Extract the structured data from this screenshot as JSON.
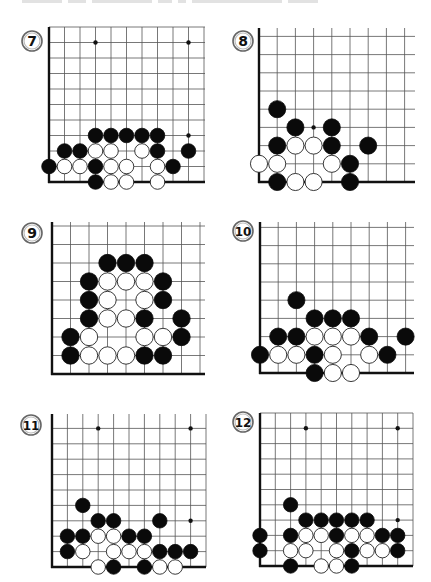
{
  "page": {
    "header_text_clipped": true
  },
  "diagrams": [
    {
      "number": "7",
      "badge": {
        "cx": 32,
        "cy": 41,
        "r": 10
      },
      "grid": {
        "origin_x": 49,
        "origin_y": 182,
        "spacing": 15.5,
        "cols": 11,
        "rows": 10,
        "right_x": 205,
        "top_y": 27
      },
      "hoshi": [
        [
          3,
          9
        ],
        [
          9,
          9
        ],
        [
          9,
          3
        ]
      ],
      "black": [
        [
          3,
          3
        ],
        [
          4,
          3
        ],
        [
          5,
          3
        ],
        [
          6,
          3
        ],
        [
          7,
          3
        ],
        [
          1,
          2
        ],
        [
          2,
          2
        ],
        [
          7,
          2
        ],
        [
          9,
          2
        ],
        [
          0,
          1
        ],
        [
          3,
          1
        ],
        [
          8,
          1
        ],
        [
          3,
          0
        ]
      ],
      "white": [
        [
          3,
          2
        ],
        [
          4,
          2
        ],
        [
          6,
          2
        ],
        [
          1,
          1
        ],
        [
          2,
          1
        ],
        [
          4,
          1
        ],
        [
          5,
          1
        ],
        [
          7,
          1
        ],
        [
          4,
          0
        ],
        [
          5,
          0
        ],
        [
          7,
          0
        ]
      ]
    },
    {
      "number": "8",
      "badge": {
        "cx": 243,
        "cy": 41,
        "r": 10
      },
      "grid": {
        "origin_x": 259,
        "origin_y": 182,
        "spacing": 18.2,
        "cols": 9,
        "rows": 9,
        "right_x": 415,
        "top_y": 28
      },
      "hoshi": [
        [
          3,
          3
        ]
      ],
      "black": [
        [
          1,
          4
        ],
        [
          2,
          3
        ],
        [
          4,
          3
        ],
        [
          1,
          2
        ],
        [
          4,
          2
        ],
        [
          6,
          2
        ],
        [
          5,
          1
        ],
        [
          1,
          0
        ],
        [
          5,
          0
        ]
      ],
      "white": [
        [
          2,
          2
        ],
        [
          3,
          2
        ],
        [
          0,
          1
        ],
        [
          1,
          1
        ],
        [
          4,
          1
        ],
        [
          2,
          0
        ],
        [
          3,
          0
        ]
      ]
    },
    {
      "number": "9",
      "badge": {
        "cx": 32,
        "cy": 233,
        "r": 10
      },
      "grid": {
        "origin_x": 52,
        "origin_y": 374,
        "spacing": 18.5,
        "cols": 9,
        "rows": 9,
        "right_x": 205,
        "top_y": 222
      },
      "hoshi": [],
      "black": [
        [
          3,
          6
        ],
        [
          4,
          6
        ],
        [
          5,
          6
        ],
        [
          2,
          5
        ],
        [
          6,
          5
        ],
        [
          2,
          4
        ],
        [
          6,
          4
        ],
        [
          2,
          3
        ],
        [
          5,
          3
        ],
        [
          7,
          3
        ],
        [
          1,
          2
        ],
        [
          7,
          2
        ],
        [
          1,
          1
        ],
        [
          5,
          1
        ],
        [
          6,
          1
        ]
      ],
      "white": [
        [
          3,
          5
        ],
        [
          4,
          5
        ],
        [
          5,
          5
        ],
        [
          3,
          4
        ],
        [
          5,
          4
        ],
        [
          3,
          3
        ],
        [
          4,
          3
        ],
        [
          2,
          2
        ],
        [
          5,
          2
        ],
        [
          6,
          2
        ],
        [
          2,
          1
        ],
        [
          3,
          1
        ],
        [
          4,
          1
        ]
      ]
    },
    {
      "number": "10",
      "badge": {
        "cx": 243,
        "cy": 231,
        "r": 10
      },
      "grid": {
        "origin_x": 260,
        "origin_y": 373,
        "spacing": 18.2,
        "cols": 9,
        "rows": 9,
        "right_x": 414,
        "top_y": 222
      },
      "hoshi": [],
      "black": [
        [
          2,
          4
        ],
        [
          3,
          3
        ],
        [
          4,
          3
        ],
        [
          5,
          3
        ],
        [
          1,
          2
        ],
        [
          2,
          2
        ],
        [
          6,
          2
        ],
        [
          8,
          2
        ],
        [
          0,
          1
        ],
        [
          3,
          1
        ],
        [
          7,
          1
        ],
        [
          3,
          0
        ]
      ],
      "white": [
        [
          3,
          2
        ],
        [
          4,
          2
        ],
        [
          5,
          2
        ],
        [
          1,
          1
        ],
        [
          2,
          1
        ],
        [
          4,
          1
        ],
        [
          6,
          1
        ],
        [
          4,
          0
        ],
        [
          5,
          0
        ]
      ]
    },
    {
      "number": "11",
      "badge": {
        "cx": 31,
        "cy": 425,
        "r": 10
      },
      "grid": {
        "origin_x": 52,
        "origin_y": 567,
        "spacing": 15.4,
        "cols": 11,
        "rows": 10,
        "right_x": 206,
        "top_y": 414
      },
      "hoshi": [
        [
          3,
          9
        ],
        [
          9,
          9
        ],
        [
          9,
          3
        ]
      ],
      "black": [
        [
          2,
          4
        ],
        [
          3,
          3
        ],
        [
          4,
          3
        ],
        [
          7,
          3
        ],
        [
          1,
          2
        ],
        [
          2,
          2
        ],
        [
          5,
          2
        ],
        [
          6,
          2
        ],
        [
          1,
          1
        ],
        [
          7,
          1
        ],
        [
          8,
          1
        ],
        [
          9,
          1
        ],
        [
          4,
          0
        ],
        [
          6,
          0
        ]
      ],
      "white": [
        [
          3,
          2
        ],
        [
          4,
          2
        ],
        [
          2,
          1
        ],
        [
          4,
          1
        ],
        [
          5,
          1
        ],
        [
          6,
          1
        ],
        [
          3,
          0
        ],
        [
          7,
          0
        ],
        [
          8,
          0
        ]
      ]
    },
    {
      "number": "12",
      "badge": {
        "cx": 243,
        "cy": 422,
        "r": 10
      },
      "grid": {
        "origin_x": 260,
        "origin_y": 566,
        "spacing": 15.3,
        "cols": 11,
        "rows": 10,
        "right_x": 413,
        "top_y": 413
      },
      "hoshi": [
        [
          3,
          9
        ],
        [
          9,
          9
        ],
        [
          9,
          3
        ]
      ],
      "black": [
        [
          2,
          4
        ],
        [
          3,
          3
        ],
        [
          4,
          3
        ],
        [
          5,
          3
        ],
        [
          6,
          3
        ],
        [
          7,
          3
        ],
        [
          0,
          2
        ],
        [
          2,
          2
        ],
        [
          5,
          2
        ],
        [
          8,
          2
        ],
        [
          9,
          2
        ],
        [
          0,
          1
        ],
        [
          6,
          1
        ],
        [
          9,
          1
        ],
        [
          2,
          0
        ],
        [
          6,
          0
        ]
      ],
      "white": [
        [
          3,
          2
        ],
        [
          4,
          2
        ],
        [
          6,
          2
        ],
        [
          7,
          2
        ],
        [
          2,
          1
        ],
        [
          3,
          1
        ],
        [
          5,
          1
        ],
        [
          7,
          1
        ],
        [
          8,
          1
        ],
        [
          4,
          0
        ],
        [
          5,
          0
        ]
      ]
    }
  ],
  "colors": {
    "black_stone": "#0a0a0a",
    "white_stone": "#ffffff",
    "grid_line": "#555555",
    "board_edge": "#111111",
    "badge_border": "#666666"
  }
}
